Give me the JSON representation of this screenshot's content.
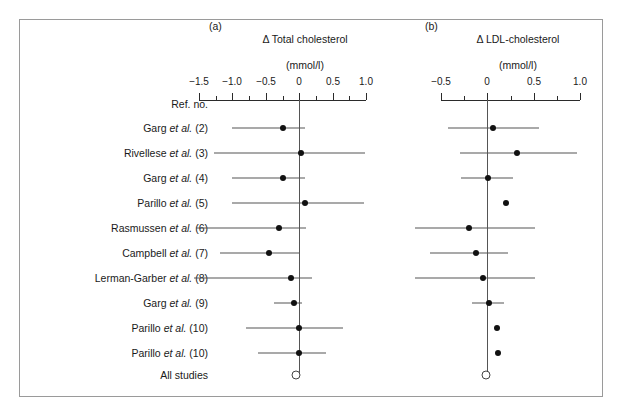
{
  "figure": {
    "panels": [
      {
        "tag": "(a)",
        "title": "Δ Total cholesterol",
        "units": "(mmol/l)"
      },
      {
        "tag": "(b)",
        "title": "Δ LDL-cholesterol",
        "units": "(mmol/l)"
      }
    ],
    "row_header": "Ref. no.",
    "summary_row_label": "All studies",
    "colors": {
      "frame": "#9a9a9a",
      "axis": "#2b2b2b",
      "marker": "#111111",
      "ci": "#555555",
      "text": "#1a1a1a"
    }
  },
  "study_labels": [
    {
      "name": "Garg",
      "etal": "et al.",
      "ref": "(2)"
    },
    {
      "name": "Rivellese",
      "etal": "et al.",
      "ref": "(3)"
    },
    {
      "name": "Garg",
      "etal": "et al.",
      "ref": "(4)"
    },
    {
      "name": "Parillo",
      "etal": "et al.",
      "ref": "(5)"
    },
    {
      "name": "Rasmussen",
      "etal": "et al.",
      "ref": "(6)"
    },
    {
      "name": "Campbell",
      "etal": "et al.",
      "ref": "(7)"
    },
    {
      "name": "Lerman-Garber",
      "etal": "et al.",
      "ref": "(8)"
    },
    {
      "name": "Garg",
      "etal": "et al.",
      "ref": "(9)"
    },
    {
      "name": "Parillo",
      "etal": "et al.",
      "ref": "(10)"
    },
    {
      "name": "Parillo",
      "etal": "et al.",
      "ref": "(10)"
    }
  ],
  "chart_data": {
    "type": "forest",
    "panels": [
      {
        "tag": "(a)",
        "xlabel": "Δ Total cholesterol (mmol/l)",
        "units": "mmol/l",
        "xlim": [
          -1.75,
          1.1
        ],
        "ticks_major": [
          -1.5,
          -1.0,
          -0.5,
          0,
          0.5,
          1.0
        ],
        "tick_labels": [
          "-1.5",
          "-1.0",
          "-0.5",
          "0",
          "0.5",
          "1.0"
        ],
        "ticks_minor": [
          -1.25,
          -0.75,
          -0.25,
          0.25,
          0.75
        ],
        "grid": false,
        "zero_reference": 0,
        "points": [
          {
            "study": "Garg et al. (2)",
            "estimate": -0.25,
            "ci_low": -1.0,
            "ci_high": 0.1
          },
          {
            "study": "Rivellese et al. (3)",
            "estimate": 0.03,
            "ci_low": -1.28,
            "ci_high": 0.98
          },
          {
            "study": "Garg et al. (4)",
            "estimate": -0.25,
            "ci_low": -1.0,
            "ci_high": 0.1
          },
          {
            "study": "Parillo et al. (5)",
            "estimate": 0.08,
            "ci_low": -1.0,
            "ci_high": 0.98
          },
          {
            "study": "Rasmussen et al. (6)",
            "estimate": -0.3,
            "ci_low": -1.55,
            "ci_high": 0.1
          },
          {
            "study": "Campbell et al. (7)",
            "estimate": -0.45,
            "ci_low": -1.18,
            "ci_high": 0.0
          },
          {
            "study": "Lerman-Garber et al. (8)",
            "estimate": -0.12,
            "ci_low": -1.58,
            "ci_high": 0.18
          },
          {
            "study": "Garg et al. (9)",
            "estimate": -0.08,
            "ci_low": -0.38,
            "ci_high": 0.04
          },
          {
            "study": "Parillo et al. (10)",
            "estimate": 0.0,
            "ci_low": -0.8,
            "ci_high": 0.65
          },
          {
            "study": "Parillo et al. (10)",
            "estimate": 0.0,
            "ci_low": -0.62,
            "ci_high": 0.4
          }
        ],
        "summary": {
          "study": "All studies",
          "estimate": -0.05,
          "marker": "open-circle"
        }
      },
      {
        "tag": "(b)",
        "xlabel": "Δ LDL-cholesterol (mmol/l)",
        "units": "mmol/l",
        "xlim": [
          -0.78,
          1.08
        ],
        "ticks_major": [
          -0.5,
          0,
          0.5,
          1.0
        ],
        "tick_labels": [
          "-0.5",
          "0",
          "0.5",
          "1.0"
        ],
        "ticks_minor": [
          -0.75,
          -0.25,
          0.25,
          0.75
        ],
        "grid": false,
        "zero_reference": 0,
        "points": [
          {
            "study": "Garg et al. (2)",
            "estimate": 0.06,
            "ci_low": -0.42,
            "ci_high": 0.56
          },
          {
            "study": "Rivellese et al. (3)",
            "estimate": 0.32,
            "ci_low": -0.3,
            "ci_high": 0.96
          },
          {
            "study": "Garg et al. (4)",
            "estimate": 0.01,
            "ci_low": -0.28,
            "ci_high": 0.28
          },
          {
            "study": "Parillo et al. (5)",
            "estimate": 0.2,
            "ci_low": null,
            "ci_high": null
          },
          {
            "study": "Rasmussen et al. (6)",
            "estimate": -0.2,
            "ci_low": -0.78,
            "ci_high": 0.52
          },
          {
            "study": "Campbell et al. (7)",
            "estimate": -0.12,
            "ci_low": -0.62,
            "ci_high": 0.22
          },
          {
            "study": "Lerman-Garber et al. (8)",
            "estimate": -0.05,
            "ci_low": -0.78,
            "ci_high": 0.52
          },
          {
            "study": "Garg et al. (9)",
            "estimate": 0.02,
            "ci_low": -0.17,
            "ci_high": 0.18
          },
          {
            "study": "Parillo et al. (10)",
            "estimate": 0.1,
            "ci_low": null,
            "ci_high": null
          },
          {
            "study": "Parillo et al. (10)",
            "estimate": 0.12,
            "ci_low": null,
            "ci_high": null
          }
        ],
        "summary": {
          "study": "All studies",
          "estimate": -0.01,
          "marker": "open-circle"
        }
      }
    ]
  }
}
